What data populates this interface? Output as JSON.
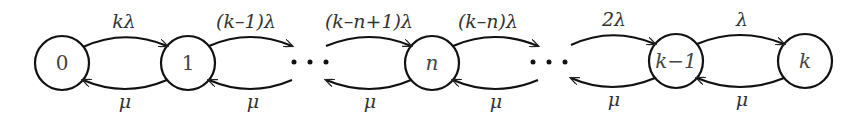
{
  "diagram": {
    "type": "birth-death state transition diagram",
    "nodes": [
      {
        "id": "0",
        "label": "0",
        "cx": 62
      },
      {
        "id": "1",
        "label": "1",
        "cx": 188
      },
      {
        "id": "n",
        "label": "n",
        "cx": 432
      },
      {
        "id": "k-1",
        "label": "k−1",
        "cx": 676
      },
      {
        "id": "k",
        "label": "k",
        "cx": 805
      }
    ],
    "ellipses": [
      "· · ·",
      "· · ·"
    ],
    "forward_rates": [
      {
        "from": "0",
        "to": "1",
        "label": "kλ"
      },
      {
        "from": "1",
        "to": "…",
        "label": "(k–1)λ"
      },
      {
        "from": "…",
        "to": "n",
        "label": "(k–n+1)λ"
      },
      {
        "from": "n",
        "to": "…",
        "label": "(k–n)λ"
      },
      {
        "from": "…",
        "to": "k-1",
        "label": "2λ"
      },
      {
        "from": "k-1",
        "to": "k",
        "label": "λ"
      }
    ],
    "backward_rates": [
      {
        "from": "1",
        "to": "0",
        "label": "μ"
      },
      {
        "from": "…",
        "to": "1",
        "label": "μ"
      },
      {
        "from": "n",
        "to": "…",
        "label": "μ"
      },
      {
        "from": "…",
        "to": "n",
        "label": "μ"
      },
      {
        "from": "k-1",
        "to": "…",
        "label": "μ"
      },
      {
        "from": "k",
        "to": "k-1",
        "label": "μ"
      }
    ]
  }
}
